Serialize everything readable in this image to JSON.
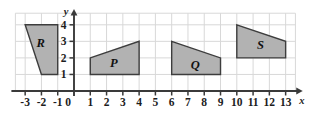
{
  "figure": {
    "type": "coordinate-grid-diagram",
    "title": "",
    "grid": {
      "visible": true,
      "color": "#d8d8d8",
      "x_min": -3.6,
      "x_max": 13.6,
      "y_min": 0,
      "y_max": 4.7,
      "cell_size": 1
    },
    "axes": {
      "x_axis_label": "x",
      "y_axis_label": "y",
      "axis_color": "#3a3a3a",
      "origin_label": "0",
      "x_ticks": [
        -3,
        -2,
        -1,
        1,
        2,
        3,
        4,
        5,
        6,
        7,
        8,
        9,
        10,
        11,
        12,
        13
      ],
      "y_ticks": [
        1,
        2,
        3,
        4
      ],
      "x_tick_labels": [
        "-3",
        "-2",
        "-1",
        "1",
        "2",
        "3",
        "4",
        "5",
        "6",
        "7",
        "8",
        "9",
        "10",
        "11",
        "12",
        "13"
      ],
      "y_tick_labels": [
        "1",
        "2",
        "3",
        "4"
      ],
      "x_arrow": true,
      "y_arrow": true
    },
    "shapes": [
      {
        "label": "R",
        "fill": "#b2b2b2",
        "stroke": "#3d3d3d",
        "vertices": [
          [
            -3,
            4
          ],
          [
            -1,
            4
          ],
          [
            -1,
            1
          ],
          [
            -2,
            1
          ]
        ],
        "label_position": [
          -2.05,
          2.85
        ]
      },
      {
        "label": "P",
        "fill": "#b2b2b2",
        "stroke": "#3d3d3d",
        "vertices": [
          [
            1,
            2
          ],
          [
            4,
            3
          ],
          [
            4,
            1
          ],
          [
            1,
            1
          ]
        ],
        "label_position": [
          2.45,
          1.65
        ]
      },
      {
        "label": "Q",
        "fill": "#b2b2b2",
        "stroke": "#3d3d3d",
        "vertices": [
          [
            6,
            3
          ],
          [
            9,
            2
          ],
          [
            9,
            1
          ],
          [
            6,
            1
          ]
        ],
        "label_position": [
          7.45,
          1.5
        ]
      },
      {
        "label": "S",
        "fill": "#b2b2b2",
        "stroke": "#3d3d3d",
        "vertices": [
          [
            10,
            4
          ],
          [
            13,
            3
          ],
          [
            13,
            2
          ],
          [
            10,
            2
          ]
        ],
        "label_position": [
          11.45,
          2.7
        ]
      }
    ]
  }
}
